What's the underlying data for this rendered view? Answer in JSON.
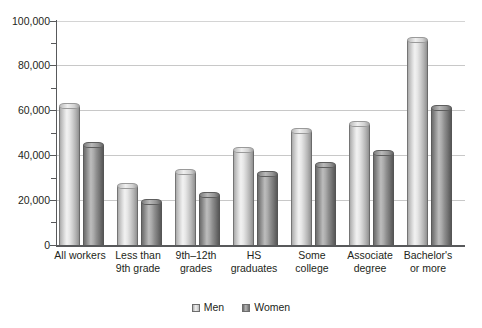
{
  "chart_data": {
    "type": "bar",
    "title": "",
    "subtitle": "",
    "xlabel": "",
    "ylabel": "",
    "ylim": [
      0,
      100000
    ],
    "ytick_values": [
      0,
      20000,
      40000,
      60000,
      80000,
      100000
    ],
    "ytick_labels": [
      "0",
      "20,000",
      "40,000",
      "60,000",
      "80,000",
      "100,000"
    ],
    "yminor_tick_values": [
      10000,
      30000,
      50000,
      70000,
      90000
    ],
    "grid": true,
    "grid_axis": "y",
    "legend_position": "bottom",
    "categories": [
      "All workers",
      "Less than 9th grade",
      "9th–12th grades",
      "HS graduates",
      "Some college",
      "Associate degree",
      "Bachelor's or more"
    ],
    "category_lines": [
      [
        "All workers"
      ],
      [
        "Less than",
        "9th grade"
      ],
      [
        "9th–12th",
        "grades"
      ],
      [
        "HS",
        "graduates"
      ],
      [
        "Some",
        "college"
      ],
      [
        "Associate",
        "degree"
      ],
      [
        "Bachelor's",
        "or more"
      ]
    ],
    "series": [
      {
        "name": "Men",
        "color": "#e0e0e0",
        "values": [
          62000,
          26500,
          32500,
          42500,
          51000,
          54000,
          91500
        ]
      },
      {
        "name": "Women",
        "color": "#808080",
        "values": [
          44500,
          19000,
          22500,
          31500,
          35500,
          41000,
          61000
        ]
      }
    ]
  },
  "legend": {
    "items": [
      {
        "label": "Men"
      },
      {
        "label": "Women"
      }
    ]
  }
}
